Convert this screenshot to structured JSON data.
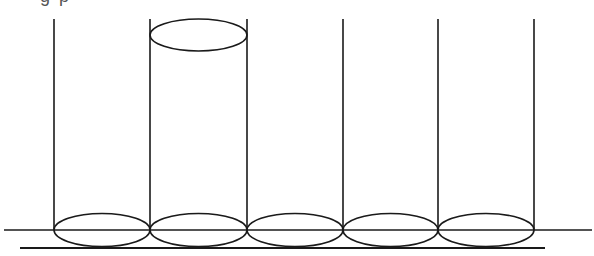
{
  "caption": {
    "visible_fragment": "g            p"
  },
  "diagram": {
    "stroke_color": "#1a1a1a",
    "background": "#ffffff",
    "cylinders": [
      {
        "left": 54,
        "right": 150,
        "has_top_cap": false
      },
      {
        "left": 150,
        "right": 247,
        "has_top_cap": true
      },
      {
        "left": 247,
        "right": 343,
        "has_top_cap": false
      },
      {
        "left": 343,
        "right": 438,
        "has_top_cap": false
      },
      {
        "left": 438,
        "right": 534,
        "has_top_cap": false
      }
    ],
    "top_y": 19,
    "base_ellipse_cy": 230,
    "base_ellipse_ry": 16,
    "top_cap": {
      "cx": 198,
      "cy": 35,
      "rx": 48,
      "ry": 16
    },
    "upper_base_line": {
      "x1": 4,
      "x2": 592,
      "y": 230
    },
    "lower_base_line": {
      "x1": 20,
      "x2": 545,
      "y": 248
    }
  }
}
